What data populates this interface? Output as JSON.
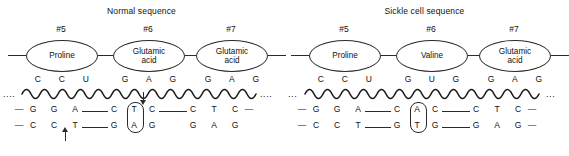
{
  "figure": {
    "background_color": "#ffffff",
    "line_color": "#2b2b2b",
    "text_color": "#111111"
  },
  "panels": [
    {
      "id": "normal",
      "title": "Normal sequence",
      "codon_numbers": [
        "#5",
        "#6",
        "#7"
      ],
      "amino_acids": [
        {
          "line1": "Proline",
          "line2": ""
        },
        {
          "line1": "Glutamic",
          "line2": "acid"
        },
        {
          "line1": "Glutamic",
          "line2": "acid"
        }
      ],
      "mrna_codons": [
        [
          "C",
          "C",
          "U"
        ],
        [
          "G",
          "A",
          "G"
        ],
        [
          "G",
          "A",
          "G"
        ]
      ],
      "mrna_left_ellipsis": "....",
      "mrna_right_ellipsis": "....",
      "dna_top_strand": [
        "G",
        "G",
        "A",
        "C",
        "T",
        "C",
        "C",
        "T",
        "C"
      ],
      "dna_bottom_strand": [
        "C",
        "C",
        "T",
        "G",
        "A",
        "G",
        "G",
        "A",
        "G"
      ],
      "dna_top_lead_dash": "—",
      "dna_top_trail_dash": "—",
      "dna_bottom_lead_dash": "—",
      "dna_bottom_trail_dash": "",
      "mutation_circle": {
        "top_base": "T",
        "bottom_base": "A"
      },
      "arrow_down": {
        "present": true,
        "points_to": "T"
      },
      "arrow_up": {
        "present": true,
        "points_to": "T"
      }
    },
    {
      "id": "sickle",
      "title": "Sickle cell sequence",
      "codon_numbers": [
        "#5",
        "#6",
        "#7"
      ],
      "amino_acids": [
        {
          "line1": "Proline",
          "line2": ""
        },
        {
          "line1": "Valine",
          "line2": ""
        },
        {
          "line1": "Glutamic",
          "line2": "acid"
        }
      ],
      "mrna_codons": [
        [
          "C",
          "C",
          "U"
        ],
        [
          "G",
          "U",
          "G"
        ],
        [
          "G",
          "A",
          "G"
        ]
      ],
      "mrna_left_ellipsis": "...",
      "mrna_right_ellipsis": "...",
      "dna_top_strand": [
        "G",
        "G",
        "A",
        "C",
        "A",
        "C",
        "C",
        "T",
        "C"
      ],
      "dna_bottom_strand": [
        "C",
        "C",
        "T",
        "G",
        "T",
        "G",
        "G",
        "A",
        "G"
      ],
      "dna_top_lead_dash": "—",
      "dna_top_trail_dash": "—",
      "dna_bottom_lead_dash": "—",
      "dna_bottom_trail_dash": "—",
      "mutation_circle": {
        "top_base": "A",
        "bottom_base": "T"
      },
      "arrow_down": {
        "present": false
      },
      "arrow_up": {
        "present": false
      }
    }
  ]
}
